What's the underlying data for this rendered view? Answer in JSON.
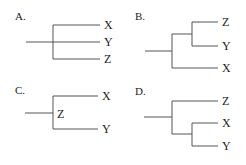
{
  "panels": [
    {
      "label": "A.",
      "tips": [
        "X",
        "Y",
        "Z"
      ],
      "node_label": ""
    },
    {
      "label": "B.",
      "tips": [
        "Z",
        "Y",
        "X"
      ],
      "node_label": ""
    },
    {
      "label": "C.",
      "tips": [
        "X",
        "Y"
      ],
      "node_label": "Z"
    },
    {
      "label": "D.",
      "tips": [
        "Z",
        "X",
        "Y"
      ],
      "node_label": ""
    }
  ]
}
